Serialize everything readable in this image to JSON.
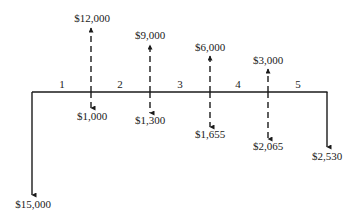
{
  "diagram": {
    "type": "cash-flow-diagram",
    "periods": [
      "1",
      "2",
      "3",
      "4",
      "5"
    ],
    "initial_outflow": {
      "period": 0,
      "label": "$15,000",
      "direction": "down",
      "style": "solid"
    },
    "inflows": [
      {
        "period": 1,
        "label": "$12,000",
        "direction": "up",
        "style": "dashed"
      },
      {
        "period": 2,
        "label": "$9,000",
        "direction": "up",
        "style": "dashed"
      },
      {
        "period": 3,
        "label": "$6,000",
        "direction": "up",
        "style": "dashed"
      },
      {
        "period": 4,
        "label": "$3,000",
        "direction": "up",
        "style": "dashed"
      }
    ],
    "outflows": [
      {
        "period": 1,
        "label": "$1,000",
        "direction": "down",
        "style": "dashed"
      },
      {
        "period": 2,
        "label": "$1,300",
        "direction": "down",
        "style": "dashed"
      },
      {
        "period": 3,
        "label": "$1,655",
        "direction": "down",
        "style": "dashed"
      },
      {
        "period": 4,
        "label": "$2,065",
        "direction": "down",
        "style": "dashed"
      },
      {
        "period": 5,
        "label": "$2,530",
        "direction": "down",
        "style": "solid"
      }
    ],
    "colors": {
      "line": "#1a1a1a",
      "background": "#ffffff"
    }
  }
}
